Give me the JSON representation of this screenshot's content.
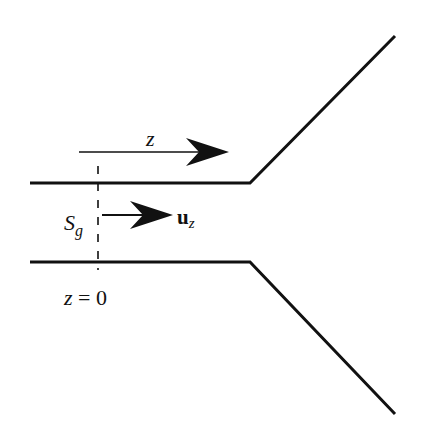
{
  "diagram": {
    "type": "nozzle-flow-schematic",
    "colors": {
      "stroke": "#111111",
      "background": "#ffffff"
    },
    "labels": {
      "axis": "z",
      "surface": "S",
      "surface_sub": "g",
      "unit_vector": "u",
      "unit_vector_sub": "z",
      "origin": "z = 0"
    },
    "elements": [
      {
        "id": "upper-wall",
        "description": "Horizontal pipe wall diverging upward"
      },
      {
        "id": "lower-wall",
        "description": "Horizontal pipe wall diverging downward"
      },
      {
        "id": "z-axis-arrow",
        "description": "Arrow indicating z direction"
      },
      {
        "id": "unit-vector-arrow",
        "description": "Arrow for unit vector u_z"
      },
      {
        "id": "section-line",
        "description": "Dashed cross-section at z = 0"
      }
    ]
  }
}
